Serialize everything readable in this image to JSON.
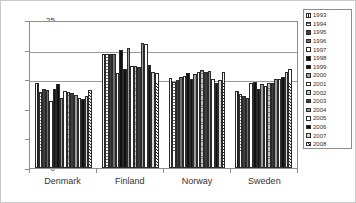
{
  "chart_data": {
    "type": "bar",
    "title": "",
    "xlabel": "",
    "ylabel": "",
    "ylim": [
      0,
      25
    ],
    "yticks": [
      0,
      5,
      10,
      15,
      20,
      25
    ],
    "gridlines": [
      15,
      20
    ],
    "grid": true,
    "legend_position": "right",
    "categories": [
      "Denmark",
      "Finland",
      "Norway",
      "Sweden"
    ],
    "series": [
      {
        "name": "1993",
        "pattern": "vertical-hatch",
        "values": [
          14.4,
          19.2,
          15.2,
          13.0
        ]
      },
      {
        "name": "1994",
        "pattern": "horizontal-lines",
        "values": [
          12.9,
          19.3,
          14.5,
          12.5
        ]
      },
      {
        "name": "1995",
        "pattern": "solid-dark",
        "values": [
          13.4,
          19.2,
          14.8,
          12.2
        ]
      },
      {
        "name": "1996",
        "pattern": "solid-gray",
        "values": [
          13.1,
          19.2,
          15.4,
          11.9
        ]
      },
      {
        "name": "1997",
        "pattern": "solid-white",
        "values": [
          11.3,
          16.0,
          15.5,
          14.3
        ]
      },
      {
        "name": "1998",
        "pattern": "solid-black",
        "values": [
          13.4,
          19.9,
          16.1,
          14.6
        ]
      },
      {
        "name": "1999",
        "pattern": "solid-black",
        "values": [
          14.2,
          16.7,
          15.0,
          13.4
        ]
      },
      {
        "name": "2000",
        "pattern": "vertical-lines-mid",
        "values": [
          11.8,
          20.3,
          15.9,
          14.2
        ]
      },
      {
        "name": "2001",
        "pattern": "solid-white",
        "values": [
          13.0,
          17.2,
          16.3,
          13.9
        ]
      },
      {
        "name": "2002",
        "pattern": "dotted-gray",
        "values": [
          12.9,
          17.3,
          16.5,
          14.4
        ]
      },
      {
        "name": "2003",
        "pattern": "solid-dark",
        "values": [
          12.6,
          17.1,
          16.2,
          14.3
        ]
      },
      {
        "name": "2004",
        "pattern": "vertical-lines-mid",
        "values": [
          12.4,
          21.2,
          16.4,
          15.0
        ]
      },
      {
        "name": "2005",
        "pattern": "solid-white",
        "values": [
          11.9,
          21.0,
          15.0,
          15.1
        ]
      },
      {
        "name": "2006",
        "pattern": "solid-black",
        "values": [
          11.6,
          17.4,
          14.4,
          15.3
        ]
      },
      {
        "name": "2007",
        "pattern": "vertical-lines-light",
        "values": [
          12.2,
          16.3,
          14.8,
          16.2
        ]
      },
      {
        "name": "2008",
        "pattern": "diagonal-hatch",
        "values": [
          13.1,
          16.0,
          16.2,
          16.8
        ]
      }
    ]
  }
}
